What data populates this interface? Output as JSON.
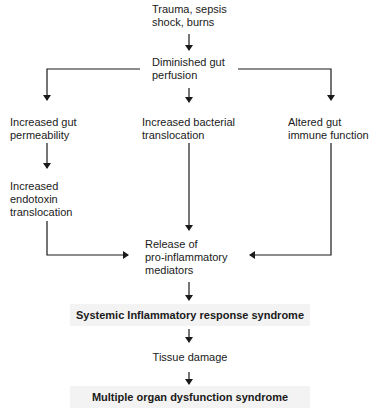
{
  "diagram": {
    "type": "flowchart",
    "nodes": {
      "trauma": "Trauma, sepsis\nshock, burns",
      "diminished": "Diminished gut\nperfusion",
      "permeability": "Increased gut\npermeability",
      "bacterial": "Increased bacterial\ntranslocation",
      "immune": "Altered gut\nimmune function",
      "endotoxin": "Increased\nendotoxin\ntranslocation",
      "release": "Release of\npro-inflammatory\nmediators",
      "sirs": "Systemic Inflammatory response syndrome",
      "tissue": "Tissue damage",
      "mods": "Multiple organ dysfunction syndrome"
    },
    "edges": [
      [
        "trauma",
        "diminished"
      ],
      [
        "diminished",
        "permeability"
      ],
      [
        "diminished",
        "bacterial"
      ],
      [
        "diminished",
        "immune"
      ],
      [
        "permeability",
        "endotoxin"
      ],
      [
        "endotoxin",
        "release"
      ],
      [
        "bacterial",
        "release"
      ],
      [
        "immune",
        "release"
      ],
      [
        "release",
        "sirs"
      ],
      [
        "sirs",
        "tissue"
      ],
      [
        "tissue",
        "mods"
      ]
    ]
  }
}
